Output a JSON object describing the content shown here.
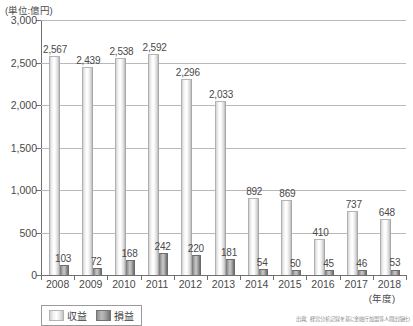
{
  "unit_label": "(単位:億円)",
  "x_unit_label": "(年度)",
  "legend": {
    "items": [
      {
        "label": "収益",
        "swatch": "revenue-swatch",
        "color": "#e8e8e8"
      },
      {
        "label": "損益",
        "swatch": "profit-swatch",
        "color": "#8d8d8d"
      }
    ]
  },
  "source_note": "出典：経営分析記録を基に金融庁加盟等人間出版社)",
  "chart_data": {
    "type": "bar",
    "title": "",
    "subtitle": "",
    "xlabel": "(年度)",
    "ylabel": "(単位:億円)",
    "categories": [
      "2008",
      "2009",
      "2010",
      "2011",
      "2012",
      "2013",
      "2014",
      "2015",
      "2016",
      "2017",
      "2018"
    ],
    "series": [
      {
        "name": "収益",
        "values": [
          2567,
          2439,
          2538,
          2592,
          2296,
          2033,
          892,
          869,
          410,
          737,
          648
        ]
      },
      {
        "name": "損益",
        "values": [
          103,
          72,
          168,
          242,
          220,
          181,
          54,
          50,
          45,
          46,
          53
        ]
      }
    ],
    "ylim": [
      0,
      3000
    ],
    "yticks": [
      0,
      500,
      1000,
      1500,
      2000,
      2500,
      3000
    ],
    "ytick_labels": [
      "0",
      "500",
      "1,000",
      "1,500",
      "2,000",
      "2,500",
      "3,000"
    ],
    "grid": true,
    "legend_position": "bottom-left",
    "data_labels": {
      "収益": [
        "2,567",
        "2,439",
        "2,538",
        "2,592",
        "2,296",
        "2,033",
        "892",
        "869",
        "410",
        "737",
        "648"
      ],
      "損益": [
        "103",
        "72",
        "168",
        "242",
        "220",
        "181",
        "54",
        "50",
        "45",
        "46",
        "53"
      ]
    }
  }
}
